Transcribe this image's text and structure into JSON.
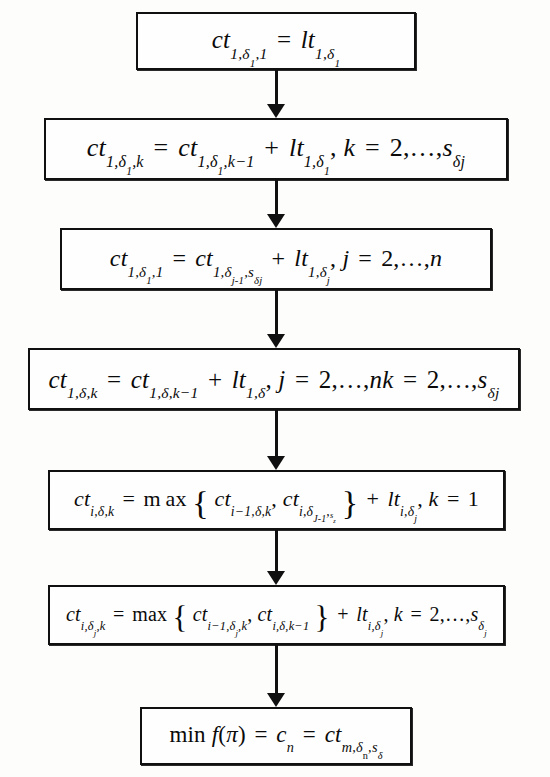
{
  "diagram": {
    "type": "flowchart",
    "orientation": "top-to-bottom",
    "background_color": "#fdfdfb",
    "border_color": "#101010",
    "text_color": "#0a0a0a",
    "node_count": 7,
    "connector_count": 6
  },
  "nodes": [
    {
      "id": "node-1",
      "index": 1,
      "formula_plain": "ct_{1,δ_1,1} = lt_{1,δ_1}",
      "parts": {
        "lhs_base": "ct",
        "lhs_sub": "1,δ₁,1",
        "relation": "=",
        "rhs_base": "lt",
        "rhs_sub": "1,δ₁"
      }
    },
    {
      "id": "node-2",
      "index": 2,
      "formula_plain": "ct_{1,δ_1,k} = ct_{1,δ_1,k-1} + lt_{1,δ_1}, k = 2,…,s_{δj}",
      "parts": {
        "lhs_base": "ct",
        "lhs_sub": "1,δ₁,k",
        "relation": "=",
        "term1_base": "ct",
        "term1_sub": "1,δ₁,k−1",
        "plus": "+",
        "term2_base": "lt",
        "term2_sub": "1,δ₁",
        "range": "k = 2,…,s",
        "range_sub": "δj"
      }
    },
    {
      "id": "node-3",
      "index": 3,
      "formula_plain": "ct_{1,δ_1,1} = ct_{1,δ_{j-1},s_{δj}} + lt_{1,δ_j}, j = 2,…,n",
      "parts": {
        "lhs_base": "ct",
        "lhs_sub": "1,δ₁,1",
        "relation": "=",
        "term1_base": "ct",
        "term1_sub": "1,δ",
        "term1_subsub": "j-1",
        "term1_sub2": ",s",
        "term1_sub2sub": "δj",
        "plus": "+",
        "term2_base": "lt",
        "term2_sub": "1,δ",
        "term2_subsub": "j",
        "range": "j = 2,…,n"
      }
    },
    {
      "id": "node-4",
      "index": 4,
      "formula_plain": "ct_{1,δ,k} = ct_{1,δ,k-1} + lt_{1,δ}, j = 2,…,nk = 2,…,s_{δj}",
      "parts": {
        "lhs_base": "ct",
        "lhs_sub": "1,δ,k",
        "relation": "=",
        "term1_base": "ct",
        "term1_sub": "1,δ,k−1",
        "plus": "+",
        "term2_base": "lt",
        "term2_sub": "1,δ",
        "range1": "j = 2,…,nk = 2,…,s",
        "range1_sub": "δj"
      }
    },
    {
      "id": "node-5",
      "index": 5,
      "formula_plain": "ct_{i,δ,k} = max{ ct_{i-1,δ,k}, ct_{i,δ_{j-1},s_z} } + lt_{i,δ_j}, k = 1",
      "parts": {
        "lhs_base": "ct",
        "lhs_sub": "i,δ,k",
        "relation": "=",
        "func": "max",
        "arg1_base": "ct",
        "arg1_sub": "i−1,δ,k",
        "arg_sep": ",",
        "arg2_base": "ct",
        "arg2_sub": "i,δ",
        "arg2_subsub": "j-1",
        "arg2_sub2": ",s",
        "arg2_sub2sub": "z",
        "plus": "+",
        "term2_base": "lt",
        "term2_sub": "i,δ",
        "term2_subsub": "j",
        "range": "k = 1"
      }
    },
    {
      "id": "node-6",
      "index": 6,
      "formula_plain": "ct_{i,δ_j,k} = max{ ct_{i-1,δ_j,k}, ct_{i,δ,k-1} } + lt_{i,δ_j}, k = 2,…,s_{δ_j}",
      "parts": {
        "lhs_base": "ct",
        "lhs_sub": "i,δ",
        "lhs_subsub": "j",
        "lhs_sub2": ",k",
        "relation": "=",
        "func": "max",
        "arg1_base": "ct",
        "arg1_sub": "i−1,δ",
        "arg1_subsub": "j",
        "arg1_sub2": ",k",
        "arg_sep": ",",
        "arg2_base": "ct",
        "arg2_sub": "i,δ,k−1",
        "plus": "+",
        "term2_base": "lt",
        "term2_sub": "i,δ",
        "term2_subsub": "j",
        "range": "k = 2,…,s",
        "range_sub": "δ",
        "range_subsub": "j"
      }
    },
    {
      "id": "node-7",
      "index": 7,
      "formula_plain": "min f(π) = c_n = ct_{m,δ_n,s_δ}",
      "parts": {
        "func": "min",
        "objective": "f(π)",
        "relation1": "=",
        "value_base": "c",
        "value_sub": "n",
        "relation2": "=",
        "rhs_base": "ct",
        "rhs_sub": "m,δ",
        "rhs_subsub": "n",
        "rhs_sub2": ",s",
        "rhs_sub2sub": "δ"
      }
    }
  ],
  "connectors": [
    {
      "id": "connector-1",
      "from": "node-1",
      "to": "node-2",
      "style": "solid-arrow-down"
    },
    {
      "id": "connector-2",
      "from": "node-2",
      "to": "node-3",
      "style": "solid-arrow-down"
    },
    {
      "id": "connector-3",
      "from": "node-3",
      "to": "node-4",
      "style": "solid-arrow-down"
    },
    {
      "id": "connector-4",
      "from": "node-4",
      "to": "node-5",
      "style": "solid-arrow-down"
    },
    {
      "id": "connector-5",
      "from": "node-5",
      "to": "node-6",
      "style": "solid-arrow-down"
    },
    {
      "id": "connector-6",
      "from": "node-6",
      "to": "node-7",
      "style": "solid-arrow-down"
    }
  ]
}
